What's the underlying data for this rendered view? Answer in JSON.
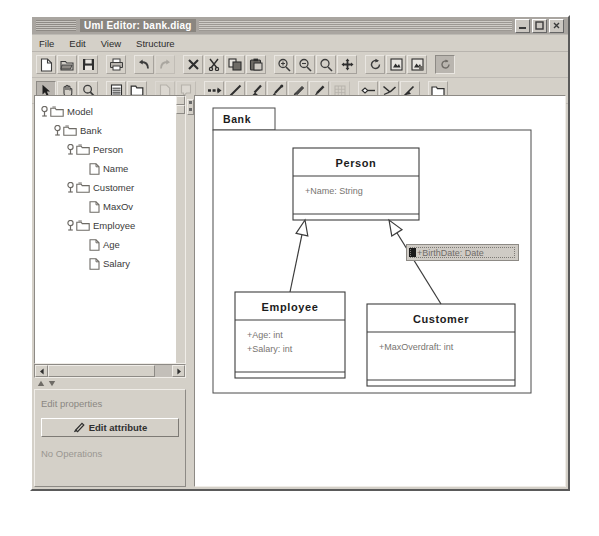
{
  "window": {
    "title": "Uml Editor: bank.diag",
    "buttons": [
      {
        "name": "minimize",
        "glyph": "minimize-icon"
      },
      {
        "name": "maximize",
        "glyph": "maximize-icon"
      },
      {
        "name": "close",
        "glyph": "close-icon"
      }
    ]
  },
  "menubar": {
    "items": [
      {
        "label": "File"
      },
      {
        "label": "Edit"
      },
      {
        "label": "View"
      },
      {
        "label": "Structure"
      }
    ]
  },
  "toolbar_row1": [
    {
      "name": "new-document-icon",
      "group": 0
    },
    {
      "name": "open-folder-icon",
      "group": 0
    },
    {
      "name": "save-disk-icon",
      "group": 0
    },
    {
      "name": "print-icon",
      "group": 1
    },
    {
      "name": "undo-icon",
      "group": 2
    },
    {
      "name": "redo-icon",
      "group": 2
    },
    {
      "name": "delete-icon",
      "group": 3
    },
    {
      "name": "cut-scissors-icon",
      "group": 3
    },
    {
      "name": "copy-icon",
      "group": 3
    },
    {
      "name": "paste-icon",
      "group": 3
    },
    {
      "name": "zoom-in-icon",
      "group": 4
    },
    {
      "name": "zoom-out-icon",
      "group": 4
    },
    {
      "name": "zoom-fit-icon",
      "group": 4
    },
    {
      "name": "move-icon",
      "group": 4
    },
    {
      "name": "refresh-icon",
      "group": 5
    },
    {
      "name": "export-image-icon",
      "group": 5
    },
    {
      "name": "import-image-icon",
      "group": 5
    },
    {
      "name": "rotate-selected-icon",
      "group": 6,
      "state": "pressed"
    }
  ],
  "toolbar_row2": [
    {
      "name": "select-arrow-icon",
      "group": 0,
      "state": "pressed"
    },
    {
      "name": "pan-hand-icon",
      "group": 0
    },
    {
      "name": "magnifier-icon",
      "group": 0
    },
    {
      "name": "class-node-icon",
      "group": 1
    },
    {
      "name": "package-node-icon",
      "group": 1
    },
    {
      "name": "note-node-icon",
      "group": 2,
      "state": "disabled"
    },
    {
      "name": "comment-node-icon",
      "group": 2,
      "state": "disabled"
    },
    {
      "name": "dependency-link-icon",
      "group": 3
    },
    {
      "name": "line-tool-icon",
      "group": 3
    },
    {
      "name": "brush-tool-icon",
      "group": 3
    },
    {
      "name": "pen-tool-icon",
      "group": 3
    },
    {
      "name": "pencil-tool-icon",
      "group": 3
    },
    {
      "name": "marker-tool-icon",
      "group": 3
    },
    {
      "name": "grid-tool-icon",
      "group": 3,
      "state": "disabled"
    },
    {
      "name": "association-icon",
      "group": 4
    },
    {
      "name": "aggregation-icon",
      "group": 4
    },
    {
      "name": "composition-icon",
      "group": 4
    },
    {
      "name": "package-shape-icon",
      "group": 5
    }
  ],
  "tree": {
    "nodes": [
      {
        "label": "Model",
        "depth": 0,
        "expanded": true,
        "kind": "folder"
      },
      {
        "label": "Bank",
        "depth": 1,
        "expanded": true,
        "kind": "folder"
      },
      {
        "label": "Person",
        "depth": 2,
        "expanded": true,
        "kind": "folder"
      },
      {
        "label": "Name",
        "depth": 3,
        "expanded": false,
        "kind": "leaf"
      },
      {
        "label": "Customer",
        "depth": 2,
        "expanded": true,
        "kind": "folder"
      },
      {
        "label": "MaxOv",
        "depth": 3,
        "expanded": false,
        "kind": "leaf"
      },
      {
        "label": "Employee",
        "depth": 2,
        "expanded": true,
        "kind": "folder"
      },
      {
        "label": "Age",
        "depth": 3,
        "expanded": false,
        "kind": "leaf"
      },
      {
        "label": "Salary",
        "depth": 3,
        "expanded": false,
        "kind": "leaf"
      }
    ]
  },
  "properties": {
    "title": "Edit properties",
    "edit_attribute_label": "Edit attribute",
    "operations_note": "No Operations"
  },
  "diagram": {
    "package": {
      "name": "Bank",
      "x": 18,
      "y": 12,
      "width": 318,
      "height": 285,
      "tab_width": 62,
      "tab_height": 22
    },
    "classes": [
      {
        "name": "Person",
        "x": 98,
        "y": 52,
        "width": 126,
        "height": 72,
        "header_height": 28,
        "attributes": [
          "+Name: String"
        ]
      },
      {
        "name": "Employee",
        "x": 40,
        "y": 196,
        "width": 110,
        "height": 86,
        "header_height": 28,
        "attributes": [
          "+Age: int",
          "+Salary: int"
        ]
      },
      {
        "name": "Customer",
        "x": 172,
        "y": 208,
        "width": 148,
        "height": 82,
        "header_height": 28,
        "attributes": [
          "+MaxOverdraft: int"
        ]
      }
    ],
    "generalizations": [
      {
        "from": "Employee",
        "to": "Person"
      },
      {
        "from": "Customer",
        "to": "Person"
      }
    ],
    "inline_editor": {
      "value": "+BirthDate: Date",
      "x": 211,
      "y": 148,
      "width": 113,
      "height": 17
    }
  }
}
